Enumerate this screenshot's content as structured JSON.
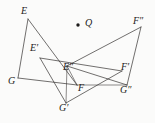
{
  "figure": {
    "background_color": "#fbfbfa",
    "ink_color": "#2e2b29",
    "width": 155,
    "height": 123,
    "center_point": {
      "name": "center-of-rotation",
      "label": "Q",
      "x": 78,
      "y": 25,
      "dot_radius": 1.7,
      "label_x": 85,
      "label_y": 18
    },
    "vertices": [
      {
        "id": "E",
        "label": "E",
        "x": 28,
        "y": 19,
        "label_x": 21,
        "label_y": 6
      },
      {
        "id": "G",
        "label": "G",
        "x": 18,
        "y": 78,
        "label_x": 8,
        "label_y": 76
      },
      {
        "id": "F",
        "label": "F",
        "x": 77,
        "y": 85,
        "label_x": 78,
        "label_y": 83
      },
      {
        "id": "Ep",
        "label": "E′",
        "x": 40,
        "y": 58,
        "label_x": 30,
        "label_y": 43
      },
      {
        "id": "Gp",
        "label": "G′",
        "x": 66,
        "y": 103,
        "label_x": 59,
        "label_y": 103
      },
      {
        "id": "Fp",
        "label": "F′",
        "x": 122,
        "y": 71,
        "label_x": 121,
        "label_y": 62
      },
      {
        "id": "Epp",
        "label": "E″",
        "x": 67,
        "y": 66,
        "label_x": 63,
        "label_y": 62
      },
      {
        "id": "Gpp",
        "label": "G″",
        "x": 127,
        "y": 85,
        "label_x": 120,
        "label_y": 85
      },
      {
        "id": "Fpp",
        "label": "F″",
        "x": 141,
        "y": 27,
        "label_x": 133,
        "label_y": 16
      }
    ],
    "segments": [
      {
        "name": "segment-E-G",
        "from": "E",
        "to": "G"
      },
      {
        "name": "segment-E-F",
        "from": "E",
        "to": "F"
      },
      {
        "name": "segment-G-F",
        "from": "G",
        "to": "F"
      },
      {
        "name": "segment-Ep-Gp",
        "from": "Ep",
        "to": "Gp"
      },
      {
        "name": "segment-Ep-Fp",
        "from": "Ep",
        "to": "Fp"
      },
      {
        "name": "segment-Gp-Fp",
        "from": "Gp",
        "to": "Fp"
      },
      {
        "name": "segment-Epp-Gpp",
        "from": "Epp",
        "to": "Gpp"
      },
      {
        "name": "segment-Epp-Fpp",
        "from": "Epp",
        "to": "Fpp"
      },
      {
        "name": "segment-Gpp-Fpp",
        "from": "Gpp",
        "to": "Fpp"
      },
      {
        "name": "segment-F-Gpp",
        "from": "F",
        "to": "Gpp"
      },
      {
        "name": "segment-Epp-Gp",
        "from": "Epp",
        "to": "Gp"
      },
      {
        "name": "segment-Epp-F",
        "from": "Epp",
        "to": "F"
      }
    ],
    "triangles": [
      {
        "name": "triangle-original",
        "vertices": [
          "E",
          "G",
          "F"
        ]
      },
      {
        "name": "triangle-image-prime",
        "vertices": [
          "Ep",
          "Gp",
          "Fp"
        ]
      },
      {
        "name": "triangle-image-dprime",
        "vertices": [
          "Epp",
          "Gpp",
          "Fpp"
        ]
      }
    ]
  }
}
